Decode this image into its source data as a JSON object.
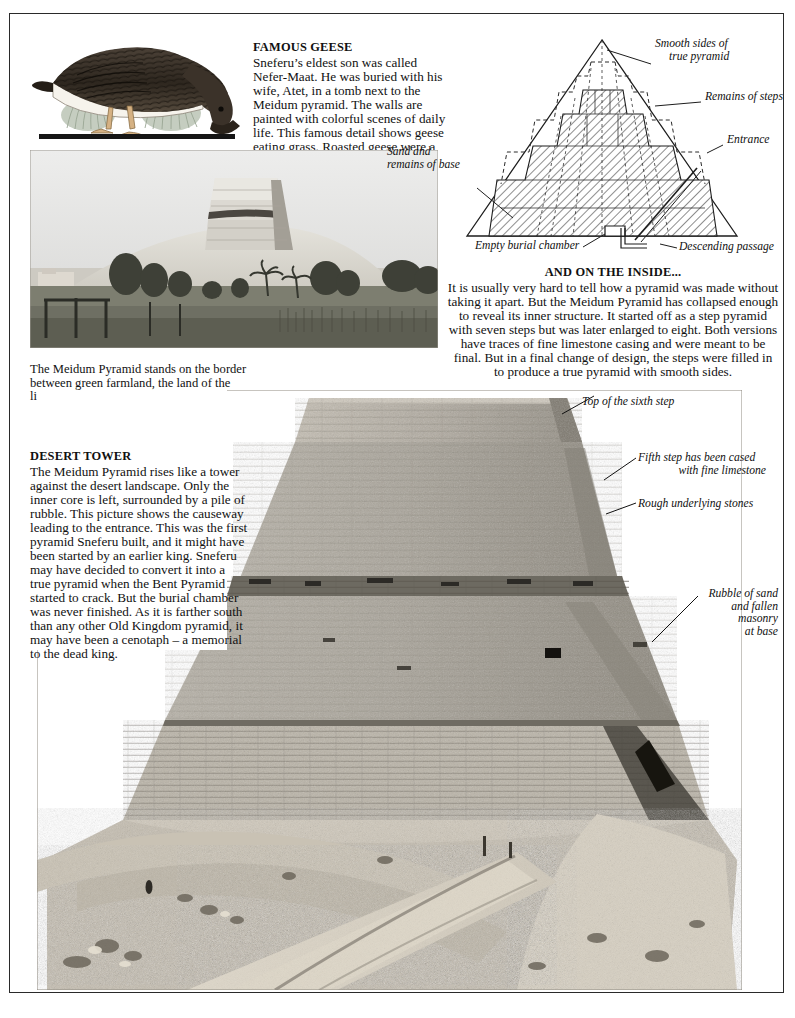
{
  "page": {
    "background": "#ffffff",
    "border_color": "#2a2a2a"
  },
  "famous_geese": {
    "heading": "FAMOUS GEESE",
    "paragraph": "Sneferu’s eldest son was called Nefer-Maat. He was buried with his wife, Atet, in a tomb next to the Meidum pyramid. The walls are painted with colorful scenes of daily life. This famous detail shows geese eating grass. Roasted geese were a great delicacy for the ancient Egyptians."
  },
  "goose_illustration": {
    "name": "egyptian-tomb-painting-goose",
    "colors": {
      "body": "#3a3129",
      "belly": "#f3f0e8",
      "legs": "#c8a06a",
      "grass": "#b9c2b0",
      "baseline": "#1a1a1a"
    }
  },
  "landscape_photo": {
    "name": "meidum-pyramid-from-farmland",
    "caption": "The Meidum Pyramid stands on the border between green farmland, the land of the living, and the desert, the land of the dead"
  },
  "cutaway_diagram": {
    "name": "meidum-pyramid-cutaway-cross-section",
    "labels": {
      "smooth_sides": "Smooth sides of\ntrue pyramid",
      "smooth_sides_line1": "Smooth sides of",
      "smooth_sides_line2": "true pyramid",
      "remains_of_steps": "Remains of steps",
      "entrance": "Entrance",
      "sand_and_base_line1": "Sand and",
      "sand_and_base_line2": "remains of base",
      "empty_burial_chamber": "Empty burial chamber",
      "descending_passage": "Descending passage"
    }
  },
  "inside_block": {
    "heading": "AND ON THE INSIDE...",
    "paragraph": "It is usually very hard to tell how a pyramid was made without taking it apart. But the Meidum Pyramid has collapsed enough to reveal its inner structure. It started off as a step pyramid with seven steps but was later enlarged to eight. Both versions have traces of fine limestone casing and were meant to be final. But in a final change of design, the steps were filled in to produce a true pyramid with smooth sides."
  },
  "desert_tower": {
    "heading": "DESERT TOWER",
    "paragraph": "The Meidum Pyramid rises like a tower against the desert landscape. Only the inner core is left, surrounded by a pile of rubble. This picture shows the causeway leading to the entrance. This was the first pyramid Sneferu built, and it might have been started by an earlier king. Sneferu may have decided to convert it into a true pyramid when the Bent Pyramid started to crack. But the burial chamber was never finished. As it is farther south than any other Old Kingdom pyramid, it may have been a cenotaph – a memorial to the dead king."
  },
  "main_photo": {
    "name": "meidum-pyramid-tower-and-causeway",
    "annotations": {
      "top_sixth_step": "Top of the sixth step",
      "fifth_step_line1": "Fifth step has been cased",
      "fifth_step_line2": "with fine limestone",
      "rough_stones": "Rough underlying stones",
      "rubble_line1": "Rubble of sand",
      "rubble_line2": "and fallen",
      "rubble_line3": "masonry",
      "rubble_line4": "at base"
    }
  }
}
